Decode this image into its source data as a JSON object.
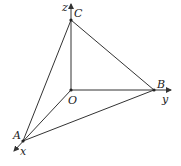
{
  "diagram": {
    "type": "3d-coordinate-tetrahedron",
    "colors": {
      "line": "#333333",
      "text": "#222222",
      "background": "#ffffff"
    },
    "axes": {
      "x": {
        "label": "x"
      },
      "y": {
        "label": "y"
      },
      "z": {
        "label": "z"
      }
    },
    "points": {
      "O": {
        "label": "O"
      },
      "A": {
        "label": "A"
      },
      "B": {
        "label": "B"
      },
      "C": {
        "label": "C"
      }
    },
    "edges": [
      "OA",
      "OB",
      "OC",
      "AB",
      "BC",
      "CA"
    ]
  }
}
